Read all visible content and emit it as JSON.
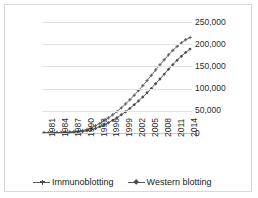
{
  "chart_data": {
    "type": "line",
    "title": "",
    "xlabel": "",
    "ylabel": "",
    "ylim": [
      0,
      250000
    ],
    "grid": true,
    "legend_position": "bottom",
    "x": [
      1981,
      1982,
      1983,
      1984,
      1985,
      1986,
      1987,
      1988,
      1989,
      1990,
      1991,
      1992,
      1993,
      1994,
      1995,
      1996,
      1997,
      1998,
      1999,
      2000,
      2001,
      2002,
      2003,
      2004,
      2005,
      2006,
      2007,
      2008,
      2009,
      2010,
      2011,
      2012,
      2013,
      2014,
      2015
    ],
    "x_tick_labels": [
      "1981",
      "1984",
      "1987",
      "1990",
      "1993",
      "1996",
      "1999",
      "2002",
      "2005",
      "2008",
      "2011",
      "2014"
    ],
    "y_tick_labels": [
      "0",
      "50,000",
      "100,000",
      "150,000",
      "200,000",
      "250,000"
    ],
    "y_tick_values": [
      0,
      50000,
      100000,
      150000,
      200000,
      250000
    ],
    "series": [
      {
        "name": "Immunoblotting",
        "marker": "cross",
        "color": "#585858",
        "values": [
          400,
          500,
          700,
          900,
          1200,
          1600,
          2100,
          2900,
          4000,
          5600,
          8000,
          11500,
          16200,
          21500,
          27500,
          34000,
          41000,
          48500,
          56500,
          65500,
          75000,
          85000,
          95500,
          106500,
          118000,
          130000,
          142000,
          153500,
          165000,
          176000,
          186000,
          195000,
          203000,
          210000,
          215000
        ]
      },
      {
        "name": "Western blotting",
        "marker": "diamond",
        "color": "#4d4d4d",
        "values": [
          200,
          250,
          350,
          480,
          650,
          880,
          1200,
          1700,
          2400,
          3400,
          5000,
          7200,
          10300,
          14000,
          18200,
          23000,
          28500,
          34500,
          41000,
          48000,
          55500,
          63500,
          72000,
          81000,
          90500,
          100500,
          111000,
          121500,
          132500,
          143500,
          154000,
          164000,
          173000,
          181500,
          189000
        ]
      }
    ]
  },
  "legend": {
    "entries": [
      {
        "label": "Immunoblotting"
      },
      {
        "label": "Western blotting"
      }
    ]
  }
}
